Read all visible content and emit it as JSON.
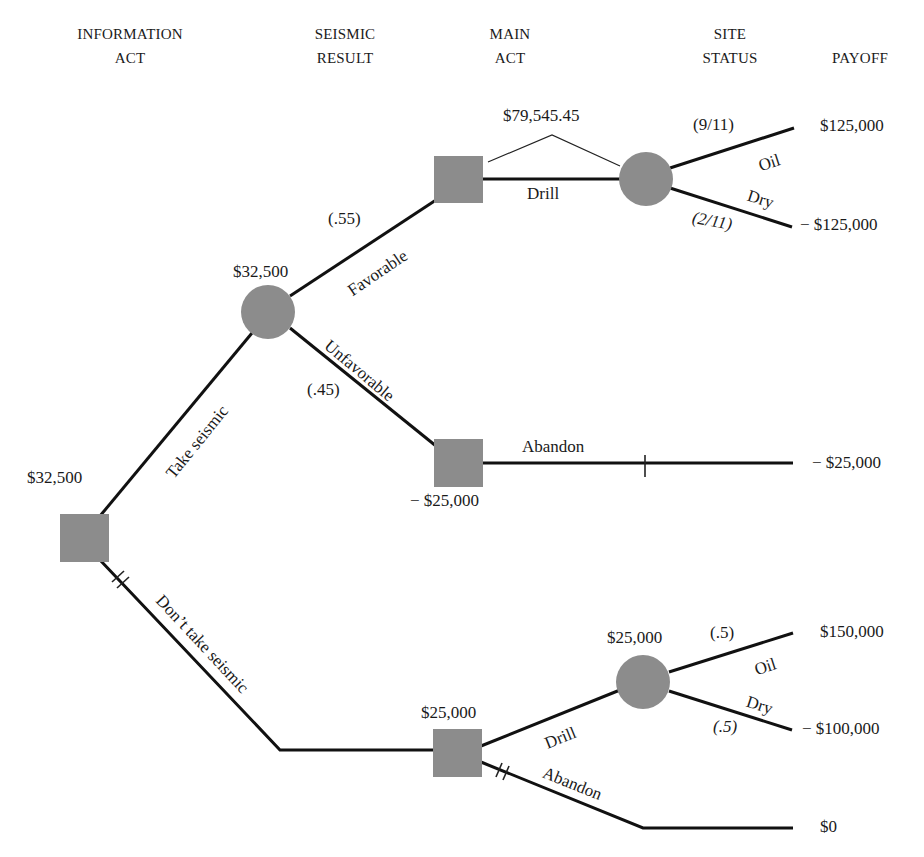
{
  "headers": {
    "information_act": [
      "INFORMATION",
      "ACT"
    ],
    "seismic_result": [
      "SEISMIC",
      "RESULT"
    ],
    "main_act": [
      "MAIN",
      "ACT"
    ],
    "site_status": [
      "SITE",
      "STATUS"
    ],
    "payoff": "PAYOFF"
  },
  "root": {
    "value": "$32,500",
    "branches": {
      "take_seismic": "Take seismic",
      "dont_take_seismic": "Don’t take seismic"
    }
  },
  "seismic_chance": {
    "value": "$32,500",
    "favorable": {
      "label": "Favorable",
      "prob": "(.55)"
    },
    "unfavorable": {
      "label": "Unfavorable",
      "prob": "(.45)"
    }
  },
  "favorable_decision": {
    "value": "$79,545.45",
    "drill_label": "Drill",
    "site_chance": {
      "oil": {
        "label": "Oil",
        "prob": "(9/11)",
        "payoff": "$125,000"
      },
      "dry": {
        "label": "Dry",
        "prob": "(2/11)",
        "payoff": "− $125,000"
      }
    }
  },
  "unfavorable_decision": {
    "value": "− $25,000",
    "abandon_label": "Abandon",
    "payoff": "− $25,000"
  },
  "no_seismic_decision": {
    "value": "$25,000",
    "drill_label": "Drill",
    "abandon_label": "Abandon",
    "site_chance": {
      "value": "$25,000",
      "oil": {
        "label": "Oil",
        "prob": "(.5)",
        "payoff": "$150,000"
      },
      "dry": {
        "label": "Dry",
        "prob": "(.5)",
        "payoff": "− $100,000"
      }
    },
    "abandon_payoff": "$0"
  },
  "colors": {
    "node_fill": "#8c8c8c",
    "edge": "#111111",
    "background": "#ffffff"
  }
}
